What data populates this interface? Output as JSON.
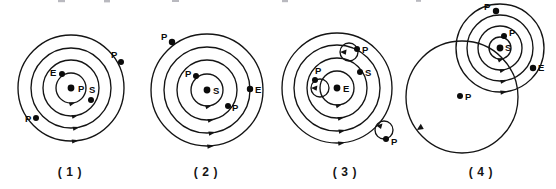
{
  "figure": {
    "width": 556,
    "height": 189,
    "background_color": "#ffffff",
    "ink_color": "#141414",
    "body_symbols": {
      "P": "planet",
      "E": "earth",
      "S": "sun"
    },
    "panels": [
      {
        "id": "panel-1",
        "caption": "( 1 )",
        "caption_x": 70,
        "caption_y": 176,
        "model": "geocentric-concentric",
        "center": {
          "x": 71,
          "y": 88
        },
        "orbits": [
          {
            "r": 15,
            "arrow_angle_deg": 70
          },
          {
            "r": 28,
            "arrow_angle_deg": 72
          },
          {
            "r": 40,
            "arrow_angle_deg": 76
          },
          {
            "r": 53,
            "arrow_angle_deg": 80
          }
        ],
        "bodies": [
          {
            "label": "P",
            "x": 71,
            "y": 88,
            "label_dx": 7,
            "label_dy": 4,
            "r": 3.4
          },
          {
            "label": "E",
            "x": 62,
            "y": 74,
            "label_dx": -12,
            "label_dy": 2,
            "r": 3.0
          },
          {
            "label": "S",
            "x": 91,
            "y": 100,
            "label_dx": -2,
            "label_dy": -7,
            "r": 3.0
          },
          {
            "label": "P",
            "x": 36,
            "y": 118,
            "label_dx": -11,
            "label_dy": 4,
            "r": 3.0
          },
          {
            "label": "P",
            "x": 121,
            "y": 62,
            "label_dx": -10,
            "label_dy": -4,
            "r": 3.0
          }
        ]
      },
      {
        "id": "panel-2",
        "caption": "( 2 )",
        "caption_x": 206,
        "caption_y": 176,
        "model": "heliocentric-concentric",
        "center": {
          "x": 207,
          "y": 90
        },
        "orbits": [
          {
            "r": 16,
            "arrow_angle_deg": 70
          },
          {
            "r": 30,
            "arrow_angle_deg": 72
          },
          {
            "r": 43,
            "arrow_angle_deg": 76
          },
          {
            "r": 56,
            "arrow_angle_deg": 80
          }
        ],
        "bodies": [
          {
            "label": "S",
            "x": 207,
            "y": 90,
            "label_dx": 6,
            "label_dy": 4,
            "r": 3.4
          },
          {
            "label": "P",
            "x": 196,
            "y": 76,
            "label_dx": -11,
            "label_dy": 1,
            "r": 3.0
          },
          {
            "label": "P",
            "x": 228,
            "y": 106,
            "label_dx": 4,
            "label_dy": 5,
            "r": 3.0
          },
          {
            "label": "E",
            "x": 250,
            "y": 89,
            "label_dx": 5,
            "label_dy": 4,
            "r": 3.2
          },
          {
            "label": "P",
            "x": 172,
            "y": 42,
            "label_dx": -11,
            "label_dy": -2,
            "r": 3.2
          }
        ]
      },
      {
        "id": "panel-3",
        "caption": "( 3 )",
        "caption_x": 345,
        "caption_y": 176,
        "model": "geocentric-epicycles",
        "center": {
          "x": 337,
          "y": 88
        },
        "orbits": [
          {
            "r": 17,
            "arrow_angle_deg": 68
          },
          {
            "r": 30,
            "arrow_angle_deg": 72
          },
          {
            "r": 43,
            "arrow_angle_deg": 76
          },
          {
            "r": 55,
            "arrow_angle_deg": 80
          }
        ],
        "epicycles": [
          {
            "cx": 320,
            "cy": 88,
            "r": 9,
            "arrow_angle_deg": 175
          },
          {
            "cx": 349,
            "cy": 52,
            "r": 9,
            "arrow_angle_deg": 175
          },
          {
            "cx": 384,
            "cy": 130,
            "r": 9,
            "arrow_angle_deg": 150
          }
        ],
        "bodies": [
          {
            "label": "E",
            "x": 337,
            "y": 88,
            "label_dx": 6,
            "label_dy": 4,
            "r": 3.4
          },
          {
            "label": "P",
            "x": 315,
            "y": 80,
            "label_dx": 0,
            "label_dy": -7,
            "r": 3.0
          },
          {
            "label": "S",
            "x": 360,
            "y": 72,
            "label_dx": 5,
            "label_dy": 4,
            "r": 3.0
          },
          {
            "label": "P",
            "x": 357,
            "y": 49,
            "label_dx": 5,
            "label_dy": 4,
            "r": 3.0
          },
          {
            "label": "P",
            "x": 386,
            "y": 139,
            "label_dx": 5,
            "label_dy": 6,
            "r": 3.0
          }
        ]
      },
      {
        "id": "panel-4",
        "caption": "( 4 )",
        "caption_x": 481,
        "caption_y": 176,
        "model": "tychonic-spiral",
        "sun_center": {
          "x": 500,
          "y": 48
        },
        "sun_orbits": [
          {
            "r": 11,
            "arrow_angle_deg": 62
          },
          {
            "r": 22,
            "arrow_angle_deg": 66
          },
          {
            "r": 33,
            "arrow_angle_deg": 70
          },
          {
            "r": 44,
            "arrow_angle_deg": 74
          }
        ],
        "big_orbit": {
          "cx": 462,
          "cy": 97,
          "r": 56,
          "arrow_angle_deg": 192
        },
        "bodies": [
          {
            "label": "S",
            "x": 500,
            "y": 48,
            "label_dx": 5,
            "label_dy": 3,
            "r": 3.4
          },
          {
            "label": "P",
            "x": 504,
            "y": 36,
            "label_dx": 5,
            "label_dy": 0,
            "r": 3.0
          },
          {
            "label": "E",
            "x": 533,
            "y": 68,
            "label_dx": 5,
            "label_dy": 3,
            "r": 3.2
          },
          {
            "label": "P",
            "x": 496,
            "y": 11,
            "label_dx": -12,
            "label_dy": -1,
            "r": 3.2
          },
          {
            "label": "P",
            "x": 460,
            "y": 96,
            "label_dx": 5,
            "label_dy": 4,
            "r": 3.0
          }
        ]
      }
    ]
  }
}
